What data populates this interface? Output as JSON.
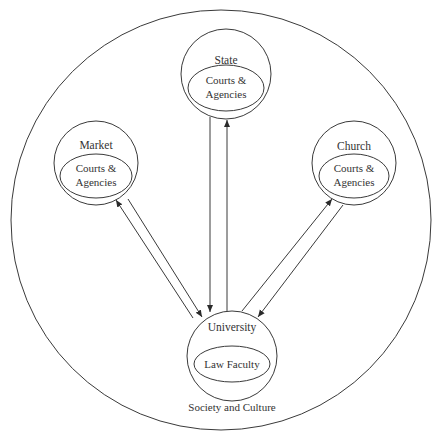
{
  "diagram": {
    "type": "institutional relationship diagram",
    "outer": {
      "label": "Society and Culture"
    },
    "nodes": [
      {
        "id": "state",
        "title": "State",
        "inner_line1": "Courts &",
        "inner_line2": "Agencies"
      },
      {
        "id": "market",
        "title": "Market",
        "inner_line1": "Courts &",
        "inner_line2": "Agencies"
      },
      {
        "id": "church",
        "title": "Church",
        "inner_line1": "Courts &",
        "inner_line2": "Agencies"
      },
      {
        "id": "university",
        "title": "University",
        "inner_line1": "Law Faculty",
        "inner_line2": ""
      }
    ],
    "edges": [
      {
        "from": "university",
        "to": "state"
      },
      {
        "from": "state",
        "to": "university"
      },
      {
        "from": "university",
        "to": "market"
      },
      {
        "from": "market",
        "to": "university"
      },
      {
        "from": "university",
        "to": "church"
      },
      {
        "from": "church",
        "to": "university"
      }
    ],
    "colors": {
      "stroke": "#3a3a3a",
      "text": "#333333",
      "background": "#ffffff"
    }
  }
}
